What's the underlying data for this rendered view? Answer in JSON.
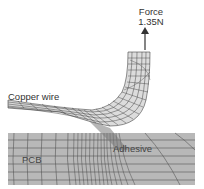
{
  "figure": {
    "type": "finite-element mesh diagram",
    "labels": {
      "force_title": "Force",
      "force_value": "1.35N",
      "copper_wire": "Copper wire",
      "adhesive": "Adhesive",
      "pcb": "PCB"
    },
    "colors": {
      "background": "#ffffff",
      "pcb_fill": "#b4b4b4",
      "wire_fill": "#d8d8d8",
      "mesh_line": "#333333",
      "arrow": "#333333"
    }
  }
}
